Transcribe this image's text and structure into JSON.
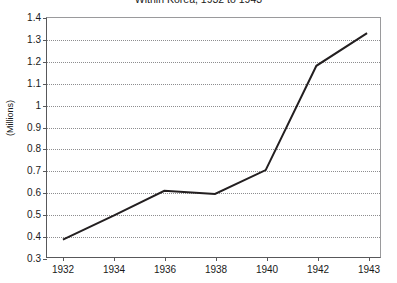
{
  "chart_data": {
    "type": "line",
    "title": "Within Korea, 1932 to 1943",
    "xlabel": "",
    "ylabel": "(Millions)",
    "categories": [
      "1932",
      "1934",
      "1936",
      "1938",
      "1940",
      "1942",
      "1943"
    ],
    "x": [
      1932,
      1934,
      1936,
      1938,
      1940,
      1942,
      1943
    ],
    "values": [
      0.38,
      0.49,
      0.605,
      0.59,
      0.7,
      1.18,
      1.33
    ],
    "series": [
      {
        "name": "",
        "values": [
          0.38,
          0.49,
          0.605,
          0.59,
          0.7,
          1.18,
          1.33
        ]
      }
    ],
    "ylim": [
      0.3,
      1.4
    ],
    "ytick_step": 0.1,
    "yticks": [
      "1.4",
      "1.3",
      "1.2",
      "1.1",
      "1",
      "0.9",
      "0.8",
      "0.7",
      "0.6",
      "0.5",
      "0.4",
      "0.3"
    ],
    "ytick_values": [
      1.4,
      1.3,
      1.2,
      1.1,
      1.0,
      0.9,
      0.8,
      0.7,
      0.6,
      0.5,
      0.4,
      0.3
    ],
    "grid": true,
    "grid_axis": "y",
    "legend": false,
    "legend_position": "none",
    "line_color": "#231f20",
    "line_width": 2,
    "markers": false,
    "axis_color": "#58585a",
    "grid_color": "#8d8d8f",
    "background": "#ffffff",
    "note": "x axis is categorical: equal spacing between tick labels although 1942 to 1943 spans one year"
  }
}
